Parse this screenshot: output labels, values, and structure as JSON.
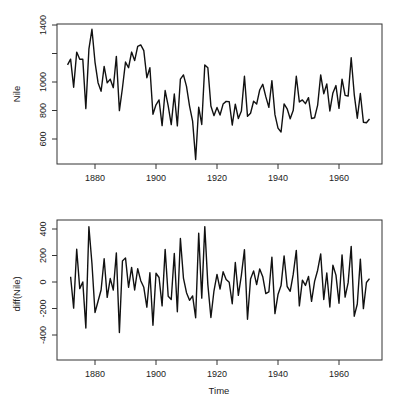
{
  "chart_data": [
    {
      "type": "line",
      "title": "",
      "xlabel": "",
      "ylabel": "Nile",
      "xlim": [
        1866,
        1975
      ],
      "ylim": [
        430,
        1400
      ],
      "xticks": [
        1880,
        1900,
        1920,
        1940,
        1960
      ],
      "xtick_labels": [
        "1880",
        "1900",
        "1920",
        "1940",
        "1960"
      ],
      "yticks": [
        600,
        800,
        1000,
        1200,
        1400
      ],
      "ytick_labels": [
        "600",
        "800",
        "1000",
        "",
        "1400"
      ],
      "grid": false,
      "x_start": 1871,
      "series": [
        {
          "name": "Nile",
          "values": [
            1120,
            1160,
            963,
            1210,
            1160,
            1160,
            813,
            1230,
            1370,
            1140,
            995,
            935,
            1110,
            994,
            1020,
            960,
            1180,
            799,
            958,
            1140,
            1100,
            1210,
            1150,
            1250,
            1260,
            1220,
            1030,
            1100,
            774,
            840,
            874,
            694,
            940,
            833,
            701,
            916,
            692,
            1020,
            1050,
            969,
            831,
            726,
            456,
            824,
            702,
            1120,
            1100,
            832,
            764,
            821,
            768,
            845,
            864,
            862,
            698,
            845,
            744,
            796,
            1040,
            759,
            781,
            865,
            845,
            944,
            984,
            897,
            822,
            1010,
            771,
            676,
            649,
            846,
            812,
            742,
            801,
            1040,
            860,
            874,
            848,
            890,
            744,
            749,
            838,
            1050,
            918,
            986,
            797,
            923,
            975,
            815,
            1020,
            906,
            901,
            1170,
            912,
            746,
            919,
            718,
            714,
            740
          ]
        }
      ]
    },
    {
      "type": "line",
      "title": "",
      "xlabel": "Time",
      "ylabel": "diff(Nile)",
      "xlim": [
        1866,
        1975
      ],
      "ylim": [
        -400,
        430
      ],
      "xticks": [
        1880,
        1900,
        1920,
        1940,
        1960
      ],
      "xtick_labels": [
        "1880",
        "1900",
        "1920",
        "1940",
        "1960"
      ],
      "yticks": [
        -400,
        -200,
        0,
        200,
        400
      ],
      "ytick_labels": [
        "-400",
        "-200",
        "0",
        "200",
        "400"
      ],
      "grid": false,
      "x_start": 1872,
      "series": [
        {
          "name": "diff(Nile)",
          "values": [
            40,
            -197,
            247,
            -50,
            0,
            -347,
            417,
            140,
            -230,
            -145,
            -60,
            175,
            -116,
            26,
            -60,
            220,
            -381,
            159,
            182,
            -40,
            110,
            -60,
            100,
            10,
            -40,
            -190,
            70,
            -326,
            66,
            34,
            -180,
            246,
            -107,
            -132,
            215,
            -224,
            328,
            30,
            -81,
            -138,
            -105,
            -270,
            368,
            -122,
            418,
            -20,
            -268,
            -68,
            57,
            -53,
            77,
            19,
            -2,
            -164,
            147,
            -101,
            52,
            244,
            -281,
            22,
            84,
            -20,
            99,
            40,
            -87,
            -75,
            188,
            -239,
            -95,
            -27,
            197,
            -34,
            -70,
            59,
            239,
            -180,
            14,
            -26,
            42,
            -146,
            5,
            89,
            212,
            -132,
            68,
            -189,
            126,
            52,
            -160,
            205,
            -114,
            -5,
            269,
            -258,
            -166,
            173,
            -201,
            -4,
            26
          ]
        }
      ]
    }
  ]
}
